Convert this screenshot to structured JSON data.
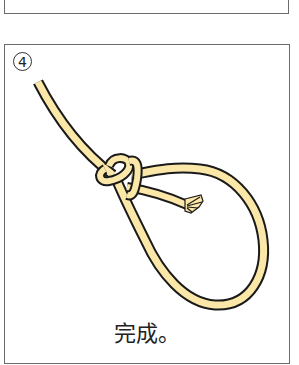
{
  "previous_step": {
    "caption": "端を輪に通す"
  },
  "step": {
    "number": "4",
    "caption": "完成。",
    "illustration": "finished-knot-loop"
  },
  "colors": {
    "rope_fill": "#FBE7A8",
    "rope_outline": "#1a1a1a",
    "panel_border": "#6b6b6b",
    "text": "#222222"
  }
}
